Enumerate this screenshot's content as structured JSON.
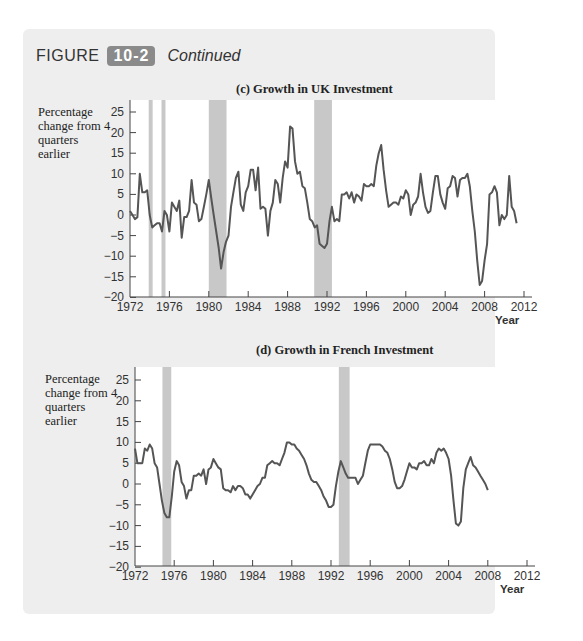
{
  "figure": {
    "word": "FIGURE",
    "number": "10-2",
    "continued": "Continued",
    "badge_color": "#8a8a8a",
    "panel_color": "#eeeeee"
  },
  "chart_data": [
    {
      "type": "line",
      "title": "(c) Growth in UK Investment",
      "xlabel": "Year",
      "ylabel": "Percentage change from 4 quarters earlier",
      "ylim": [
        -20,
        25
      ],
      "xlim": [
        1972,
        2012
      ],
      "yticks": [
        25,
        20,
        15,
        10,
        5,
        0,
        -5,
        -10,
        -15,
        -20
      ],
      "xticks": [
        1972,
        1976,
        1980,
        1984,
        1988,
        1992,
        1996,
        2000,
        2004,
        2008,
        2012
      ],
      "grid": false,
      "line_color": "#555555",
      "recession_bands": [
        [
          1973.9,
          1974.3
        ],
        [
          1975.2,
          1975.6
        ],
        [
          1980.0,
          1981.8
        ],
        [
          1990.7,
          1992.5
        ]
      ],
      "series": [
        {
          "name": "UK investment growth",
          "x": [
            1972.0,
            1972.25,
            1972.5,
            1972.75,
            1973.0,
            1973.25,
            1973.5,
            1973.75,
            1974.0,
            1974.25,
            1974.5,
            1974.75,
            1975.0,
            1975.25,
            1975.5,
            1975.75,
            1976.0,
            1976.25,
            1976.5,
            1976.75,
            1977.0,
            1977.25,
            1977.5,
            1977.75,
            1978.0,
            1978.25,
            1978.5,
            1978.75,
            1979.0,
            1979.25,
            1979.5,
            1979.75,
            1980.0,
            1980.25,
            1980.5,
            1980.75,
            1981.0,
            1981.25,
            1981.5,
            1981.75,
            1982.0,
            1982.25,
            1982.5,
            1982.75,
            1983.0,
            1983.25,
            1983.5,
            1983.75,
            1984.0,
            1984.25,
            1984.5,
            1984.75,
            1985.0,
            1985.25,
            1985.5,
            1985.75,
            1986.0,
            1986.25,
            1986.5,
            1986.75,
            1987.0,
            1987.25,
            1987.5,
            1987.75,
            1988.0,
            1988.25,
            1988.5,
            1988.75,
            1989.0,
            1989.25,
            1989.5,
            1989.75,
            1990.0,
            1990.25,
            1990.5,
            1990.75,
            1991.0,
            1991.25,
            1991.5,
            1991.75,
            1992.0,
            1992.25,
            1992.5,
            1992.75,
            1993.0,
            1993.25,
            1993.5,
            1993.75,
            1994.0,
            1994.25,
            1994.5,
            1994.75,
            1995.0,
            1995.25,
            1995.5,
            1995.75,
            1996.0,
            1996.25,
            1996.5,
            1996.75,
            1997.0,
            1997.25,
            1997.5,
            1997.75,
            1998.0,
            1998.25,
            1998.5,
            1998.75,
            1999.0,
            1999.25,
            1999.5,
            1999.75,
            2000.0,
            2000.25,
            2000.5,
            2000.75,
            2001.0,
            2001.25,
            2001.5,
            2001.75,
            2002.0,
            2002.25,
            2002.5,
            2002.75,
            2003.0,
            2003.25,
            2003.5,
            2003.75,
            2004.0,
            2004.25,
            2004.5,
            2004.75,
            2005.0,
            2005.25,
            2005.5,
            2005.75,
            2006.0,
            2006.25,
            2006.5,
            2006.75,
            2007.0,
            2007.25,
            2007.5,
            2007.75,
            2008.0,
            2008.25,
            2008.5,
            2008.75,
            2009.0,
            2009.25,
            2009.5,
            2009.75,
            2010.0,
            2010.25,
            2010.5,
            2010.75,
            2011.0,
            2011.25,
            2011.5,
            2011.75,
            2012.0
          ],
          "y": [
            1,
            0,
            -1,
            -0.5,
            10,
            5.5,
            5.5,
            6,
            0,
            -3,
            -2.5,
            -2,
            -2,
            -4,
            1,
            0,
            -4,
            3,
            2,
            1,
            3.5,
            -5.5,
            -0.5,
            -0.5,
            1,
            8.5,
            3,
            2.5,
            -1.5,
            -1,
            2,
            5,
            8.5,
            4,
            0,
            -4,
            -8,
            -13,
            -9,
            -6.5,
            -5,
            2,
            5.5,
            9,
            10.5,
            2.5,
            1,
            5.5,
            7,
            11,
            11,
            6,
            11.5,
            1.5,
            2,
            1.5,
            -5,
            1,
            3,
            8.5,
            7.5,
            3,
            9,
            13,
            11.5,
            21.5,
            21,
            13,
            10,
            10.5,
            7,
            6.5,
            3,
            -1,
            -1.5,
            -3,
            -2.5,
            -7,
            -7.5,
            -8,
            -7,
            -1.5,
            2,
            -1.5,
            -1,
            -1.5,
            5,
            5,
            5.5,
            4,
            5.5,
            3,
            5,
            4.5,
            3.5,
            7.5,
            7,
            7,
            7.5,
            7,
            12,
            15,
            17,
            11,
            6,
            2,
            2.5,
            3,
            3,
            2.5,
            4.5,
            4,
            6,
            5,
            0,
            2.5,
            3,
            4.5,
            10,
            5.5,
            2,
            0.5,
            1,
            5.5,
            9.5,
            9.5,
            5,
            3,
            1.5,
            6.5,
            7,
            9.5,
            9,
            4.5,
            8.5,
            9,
            9,
            10,
            7,
            1,
            -4,
            -11,
            -17,
            -16,
            -11,
            -7,
            5,
            5.5,
            7,
            5.5,
            -2.5,
            0,
            -1,
            0,
            9.5,
            2,
            1,
            -2
          ]
        }
      ]
    },
    {
      "type": "line",
      "title": "(d) Growth in French Investment",
      "xlabel": "Year",
      "ylabel": "Percentage change from 4 quarters earlier",
      "ylim": [
        -20,
        25
      ],
      "xlim": [
        1972,
        2012
      ],
      "yticks": [
        25,
        20,
        15,
        10,
        5,
        0,
        -5,
        -10,
        -15,
        -20
      ],
      "xticks": [
        1972,
        1976,
        1980,
        1984,
        1988,
        1992,
        1996,
        2000,
        2004,
        2008,
        2012
      ],
      "grid": false,
      "line_color": "#555555",
      "recession_bands": [
        [
          1974.8,
          1975.7
        ],
        [
          1992.8,
          1993.9
        ]
      ],
      "series": [
        {
          "name": "French investment growth",
          "x": [
            1972.0,
            1972.25,
            1972.5,
            1972.75,
            1973.0,
            1973.25,
            1973.5,
            1973.75,
            1974.0,
            1974.25,
            1974.5,
            1974.75,
            1975.0,
            1975.25,
            1975.5,
            1975.75,
            1976.0,
            1976.25,
            1976.5,
            1976.75,
            1977.0,
            1977.25,
            1977.5,
            1977.75,
            1978.0,
            1978.25,
            1978.5,
            1978.75,
            1979.0,
            1979.25,
            1979.5,
            1979.75,
            1980.0,
            1980.25,
            1980.5,
            1980.75,
            1981.0,
            1981.25,
            1981.5,
            1981.75,
            1982.0,
            1982.25,
            1982.5,
            1982.75,
            1983.0,
            1983.25,
            1983.5,
            1983.75,
            1984.0,
            1984.25,
            1984.5,
            1984.75,
            1985.0,
            1985.25,
            1985.5,
            1985.75,
            1986.0,
            1986.25,
            1986.5,
            1986.75,
            1987.0,
            1987.25,
            1987.5,
            1987.75,
            1988.0,
            1988.25,
            1988.5,
            1988.75,
            1989.0,
            1989.25,
            1989.5,
            1989.75,
            1990.0,
            1990.25,
            1990.5,
            1990.75,
            1991.0,
            1991.25,
            1991.5,
            1991.75,
            1992.0,
            1992.25,
            1992.5,
            1992.75,
            1993.0,
            1993.25,
            1993.5,
            1993.75,
            1994.0,
            1994.25,
            1994.5,
            1994.75,
            1995.0,
            1995.25,
            1995.5,
            1995.75,
            1996.0,
            1996.25,
            1996.5,
            1996.75,
            1997.0,
            1997.25,
            1997.5,
            1997.75,
            1998.0,
            1998.25,
            1998.5,
            1998.75,
            1999.0,
            1999.25,
            1999.5,
            1999.75,
            2000.0,
            2000.25,
            2000.5,
            2000.75,
            2001.0,
            2001.25,
            2001.5,
            2001.75,
            2002.0,
            2002.25,
            2002.5,
            2002.75,
            2003.0,
            2003.25,
            2003.5,
            2003.75,
            2004.0,
            2004.25,
            2004.5,
            2004.75,
            2005.0,
            2005.25,
            2005.5,
            2005.75,
            2006.0,
            2006.25,
            2006.5,
            2006.75,
            2007.0,
            2007.25,
            2007.5,
            2007.75,
            2008.0,
            2008.25,
            2008.5,
            2008.75,
            2009.0,
            2009.25,
            2009.5,
            2009.75,
            2010.0,
            2010.25,
            2010.5,
            2010.75,
            2011.0,
            2011.25,
            2011.5,
            2011.75,
            2012.0
          ],
          "y": [
            8.5,
            5,
            5,
            5,
            8.5,
            8,
            9.5,
            8.5,
            5,
            4,
            0,
            -4,
            -7,
            -8,
            -8,
            -3,
            3,
            5.5,
            4.5,
            0.5,
            -0.5,
            -3.5,
            -1.5,
            -1.5,
            2,
            2,
            2.5,
            2,
            3.5,
            0,
            3.5,
            4,
            6,
            5,
            4,
            3.5,
            -1,
            -1.5,
            -1.5,
            -2,
            -0.5,
            -1.5,
            -0.5,
            -0.5,
            -1,
            -2.5,
            -2.5,
            -3.5,
            -2.5,
            -1.5,
            -0.5,
            0,
            1.5,
            1.5,
            4.5,
            5,
            5.5,
            5,
            5,
            4.5,
            6,
            7.5,
            10,
            10,
            9.5,
            9.5,
            8.5,
            8,
            7,
            6,
            4.5,
            2.5,
            1,
            0.5,
            0.5,
            -0.5,
            -1.5,
            -3,
            -4,
            -5.5,
            -5.5,
            -5,
            -0.5,
            3,
            5.5,
            4,
            2.5,
            1.5,
            1.5,
            1.5,
            1.5,
            0,
            1,
            2,
            5,
            8,
            9.5,
            9.5,
            9.5,
            9.5,
            9.5,
            9,
            8,
            7.5,
            6,
            3.5,
            0.5,
            -1,
            -1,
            -0.5,
            1,
            3,
            5,
            4,
            4,
            3.5,
            5,
            5,
            5.5,
            4.5,
            4.5,
            6,
            5,
            7.5,
            8.5,
            8,
            8.5,
            7.5,
            6,
            2,
            -4,
            -9.5,
            -10,
            -9,
            -1,
            3.5,
            5,
            6.5,
            4.5,
            4,
            3,
            2,
            1,
            0,
            -1.5
          ]
        }
      ]
    }
  ]
}
